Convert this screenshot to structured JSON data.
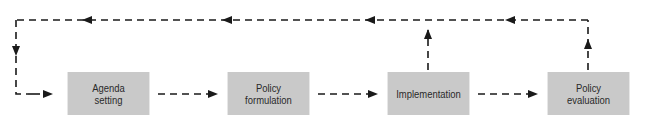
{
  "diagram": {
    "type": "policy-cycle flowchart",
    "boxes": [
      {
        "id": "agenda",
        "line1": "Agenda",
        "line2": "setting"
      },
      {
        "id": "formulation",
        "line1": "Policy",
        "line2": "formulation"
      },
      {
        "id": "implementation",
        "line1": "Implementation",
        "line2": ""
      },
      {
        "id": "evaluation",
        "line1": "Policy",
        "line2": "evaluation"
      }
    ],
    "edges": [
      {
        "from": "agenda",
        "to": "formulation",
        "style": "dashed"
      },
      {
        "from": "formulation",
        "to": "implementation",
        "style": "dashed"
      },
      {
        "from": "implementation",
        "to": "evaluation",
        "style": "dashed"
      },
      {
        "from": "evaluation",
        "to": "agenda",
        "style": "dashed",
        "route": "feedback loop over top"
      },
      {
        "from": "implementation",
        "to": "agenda",
        "style": "dashed",
        "route": "feedback loop over top"
      }
    ],
    "colors": {
      "box_fill": "#c9c9c9",
      "line": "#1a1a1a",
      "text": "#2a2a2a"
    }
  }
}
